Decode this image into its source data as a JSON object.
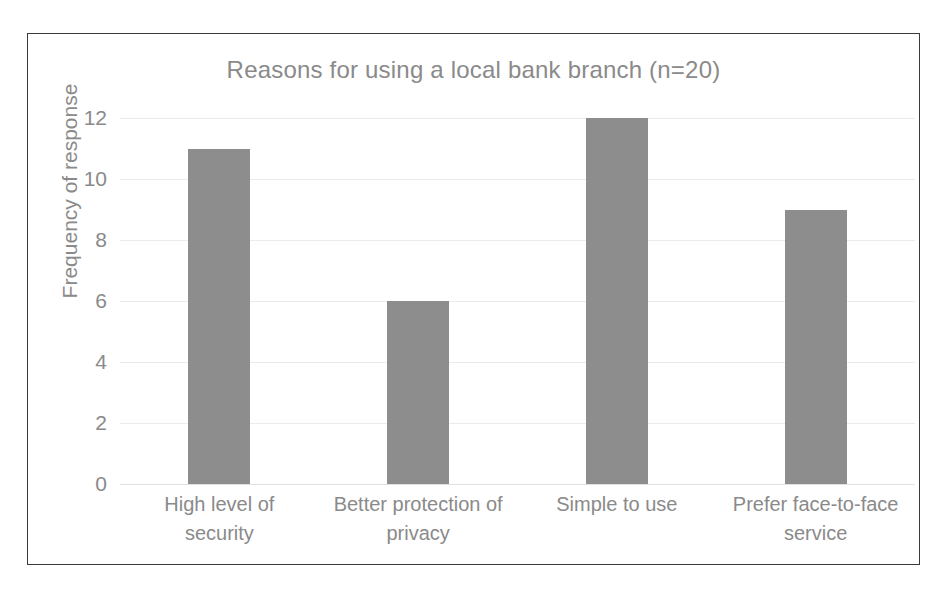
{
  "chart_data": {
    "type": "bar",
    "title": "Reasons for using a local bank branch (n=20)",
    "xlabel": "",
    "ylabel": "Frequency of response",
    "categories": [
      "High level of security",
      "Better protection of privacy",
      "Simple to use",
      "Prefer face-to-face service"
    ],
    "category_lines": [
      [
        "High level of",
        "security"
      ],
      [
        "Better protection of",
        "privacy"
      ],
      [
        "Simple to use",
        ""
      ],
      [
        "Prefer face-to-face",
        "service"
      ]
    ],
    "values": [
      11,
      6,
      12,
      9
    ],
    "ylim": [
      0,
      12
    ],
    "yticks": [
      0,
      2,
      4,
      6,
      8,
      10,
      12
    ],
    "ytick_labels": [
      "0",
      "2",
      "4",
      "6",
      "8",
      "10",
      "12"
    ],
    "grid": true,
    "legend": false,
    "legend_position": "none",
    "bar_color": "#8d8d8d",
    "text_color": "#8a8a8a",
    "gridline_color": "#eceaea",
    "border_color": "#3b3b3b",
    "background_color": "#ffffff"
  }
}
